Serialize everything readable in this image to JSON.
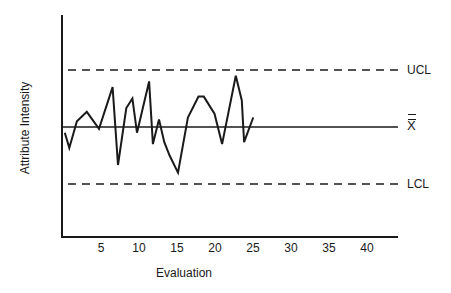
{
  "chart_data": {
    "type": "line",
    "title": "",
    "xlabel": "Evaluation",
    "ylabel": "Attribute Intensity",
    "xlim": [
      0,
      44
    ],
    "ylim": [
      -5.8,
      5.8
    ],
    "x_ticks": [
      5,
      10,
      15,
      20,
      25,
      30,
      35,
      40
    ],
    "y_ticks": [],
    "grid": false,
    "legend": null,
    "control_lines": [
      {
        "name": "UCL",
        "label": "UCL",
        "value": 3.0,
        "style": "dashed"
      },
      {
        "name": "center",
        "label": "X̅̅",
        "value": 0.0,
        "style": "solid"
      },
      {
        "name": "LCL",
        "label": "LCL",
        "value": -3.0,
        "style": "dashed"
      }
    ],
    "series": [
      {
        "name": "Attribute Intensity",
        "x": [
          0.1,
          0.7,
          1.7,
          3.0,
          4.6,
          6.4,
          7.1,
          8.2,
          9.0,
          9.6,
          11.2,
          11.7,
          12.5,
          13.2,
          13.9,
          15.0,
          16.3,
          17.7,
          18.4,
          19.8,
          20.8,
          22.6,
          23.4,
          23.7,
          24.9
        ],
        "values": [
          -0.3,
          -1.1,
          0.3,
          0.8,
          -0.1,
          2.1,
          -2.0,
          1.0,
          1.5,
          -0.3,
          2.4,
          -0.9,
          0.4,
          -0.8,
          -1.5,
          -2.4,
          0.5,
          1.6,
          1.6,
          0.7,
          -0.9,
          2.7,
          1.4,
          -0.8,
          0.5
        ]
      }
    ],
    "annotations": [
      "UCL",
      "X double-bar (grand mean)",
      "LCL"
    ]
  },
  "labels": {
    "ucl": "UCL",
    "center": "X",
    "lcl": "LCL",
    "xlabel": "Evaluation",
    "ylabel": "Attribute Intensity",
    "ticks": [
      "5",
      "10",
      "15",
      "20",
      "25",
      "30",
      "35",
      "40"
    ]
  },
  "colors": {
    "line": "#1a1a1a",
    "background": "#ffffff"
  }
}
